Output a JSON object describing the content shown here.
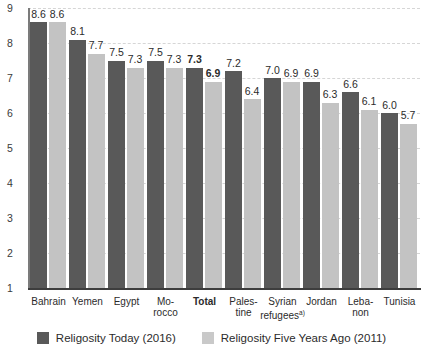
{
  "chart_data": {
    "type": "bar",
    "title": "",
    "xlabel": "",
    "ylabel": "",
    "ylim": [
      1,
      9
    ],
    "yticks": [
      1,
      2,
      3,
      4,
      5,
      6,
      7,
      8,
      9
    ],
    "grid": true,
    "legend_position": "bottom",
    "categories": [
      "Bahrain",
      "Yemen",
      "Egypt",
      "Mo-rocco",
      "Total",
      "Pales-tine",
      "Syrian refugees",
      "Jordan",
      "Leba-non",
      "Tunisia"
    ],
    "category_lines": [
      [
        "Bahrain"
      ],
      [
        "Yemen"
      ],
      [
        "Egypt"
      ],
      [
        "Mo-",
        "rocco"
      ],
      [
        "Total"
      ],
      [
        "Pales-",
        "tine"
      ],
      [
        "Syrian",
        "refugees"
      ],
      [
        "Jordan"
      ],
      [
        "Leba-",
        "non"
      ],
      [
        "Tunisia"
      ]
    ],
    "category_bold": [
      false,
      false,
      false,
      false,
      true,
      false,
      false,
      false,
      false,
      false
    ],
    "category_footnote_index": 6,
    "category_footnote_marker": "a)",
    "series": [
      {
        "name": "Religosity Today (2016)",
        "color": "#595959",
        "values": [
          8.6,
          8.1,
          7.5,
          7.5,
          7.3,
          7.2,
          7.0,
          6.9,
          6.6,
          6.0
        ],
        "labels": [
          "8.6",
          "8.1",
          "7.5",
          "7.5",
          "7.3",
          "7.2",
          "7.0",
          "6.9",
          "6.6",
          "6.0"
        ],
        "label_bold": [
          false,
          false,
          false,
          false,
          true,
          false,
          false,
          false,
          false,
          false
        ]
      },
      {
        "name": "Religosity Five Years Ago (2011)",
        "color": "#c3c3c3",
        "values": [
          8.6,
          7.7,
          7.3,
          7.3,
          6.9,
          6.4,
          6.9,
          6.3,
          6.1,
          5.7
        ],
        "labels": [
          "8.6",
          "7.7",
          "7.3",
          "7.3",
          "6.9",
          "6.4",
          "6.9",
          "6.3",
          "6.1",
          "5.7"
        ],
        "label_bold": [
          false,
          false,
          false,
          false,
          true,
          false,
          false,
          false,
          false,
          false
        ]
      }
    ]
  },
  "legend": {
    "items": [
      {
        "label": "Religosity Today (2016)",
        "color": "#595959"
      },
      {
        "label": "Religosity Five Years Ago (2011)",
        "color": "#c9c9c9"
      }
    ]
  },
  "colors": {
    "bar_today": "#595959",
    "bar_past": "#c3c3c3",
    "gridline": "#d6d6d6",
    "axis": "#3d3d3d",
    "background": "#ffffff"
  }
}
